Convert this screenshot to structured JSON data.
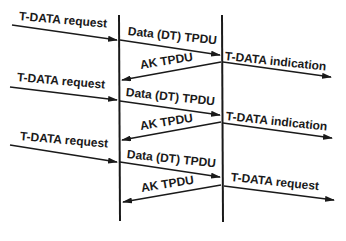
{
  "diagram": {
    "type": "sequence",
    "lifelines": [
      {
        "id": "sender",
        "x": 119
      },
      {
        "id": "receiver",
        "x": 222
      }
    ],
    "colors": {
      "line": "#1a1a1a",
      "background": "#ffffff"
    },
    "rows": [
      {
        "left_label": "T-DATA request",
        "data_label": "Data (DT) TPDU",
        "ack_label": "AK TPDU",
        "right_label": "T-DATA indication"
      },
      {
        "left_label": "T-DATA request",
        "data_label": "Data (DT) TPDU",
        "ack_label": "AK TPDU",
        "right_label": "T-DATA indication"
      },
      {
        "left_label": "T-DATA request",
        "data_label": "Data (DT) TPDU",
        "ack_label": "AK TPDU",
        "right_label": "T-DATA request"
      }
    ]
  }
}
